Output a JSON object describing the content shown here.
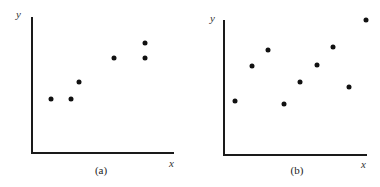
{
  "chart_data": [
    {
      "type": "scatter",
      "caption": "(a)",
      "xlabel": "x",
      "ylabel": "y",
      "grid": false,
      "ticks": false,
      "xlim": [
        0,
        142
      ],
      "ylim": [
        0,
        136
      ],
      "points": [
        {
          "x": 19,
          "y": 54
        },
        {
          "x": 39,
          "y": 54
        },
        {
          "x": 47,
          "y": 71
        },
        {
          "x": 82,
          "y": 95
        },
        {
          "x": 113,
          "y": 95
        },
        {
          "x": 113,
          "y": 110
        }
      ]
    },
    {
      "type": "scatter",
      "caption": "(b)",
      "xlabel": "x",
      "ylabel": "y",
      "grid": false,
      "ticks": false,
      "xlim": [
        0,
        143
      ],
      "ylim": [
        0,
        135
      ],
      "points": [
        {
          "x": 11,
          "y": 54
        },
        {
          "x": 28,
          "y": 89
        },
        {
          "x": 44,
          "y": 105
        },
        {
          "x": 60,
          "y": 51
        },
        {
          "x": 76,
          "y": 73
        },
        {
          "x": 93,
          "y": 90
        },
        {
          "x": 109,
          "y": 108
        },
        {
          "x": 125,
          "y": 68
        },
        {
          "x": 142,
          "y": 135
        }
      ]
    }
  ],
  "panels": [
    {
      "caption": "(a)",
      "xlabel": "x",
      "ylabel": "y"
    },
    {
      "caption": "(b)",
      "xlabel": "x",
      "ylabel": "y"
    }
  ],
  "colors": {
    "axis": "#1a1a1a",
    "point": "#111111",
    "background": "#ffffff"
  }
}
